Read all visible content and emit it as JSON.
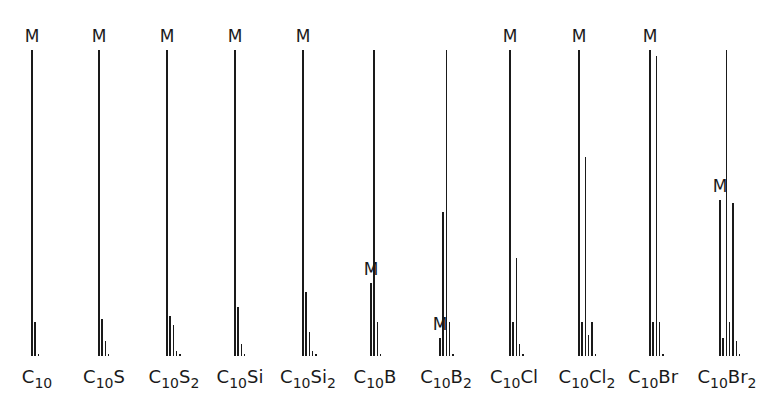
{
  "chart_data": {
    "type": "bar",
    "title": "",
    "xlabel": "",
    "ylabel": "",
    "ylim": [
      0,
      100
    ],
    "grid": false,
    "legend": null,
    "marker_label": "M",
    "groups": [
      {
        "name": "C10",
        "label_parts": [
          [
            "C",
            ""
          ],
          [
            "10",
            "sub"
          ]
        ],
        "m_index": 0,
        "values": [
          100,
          11,
          0.5
        ]
      },
      {
        "name": "C10S",
        "label_parts": [
          [
            "C",
            ""
          ],
          [
            "10",
            "sub"
          ],
          [
            "S",
            ""
          ]
        ],
        "m_index": 0,
        "values": [
          100,
          12,
          5,
          0.5
        ]
      },
      {
        "name": "C10S2",
        "label_parts": [
          [
            "C",
            ""
          ],
          [
            "10",
            "sub"
          ],
          [
            "S",
            ""
          ],
          [
            "2",
            "sub"
          ]
        ],
        "m_index": 0,
        "values": [
          100,
          13,
          10,
          1.5,
          0.5
        ]
      },
      {
        "name": "C10Si",
        "label_parts": [
          [
            "C",
            ""
          ],
          [
            "10",
            "sub"
          ],
          [
            "Si",
            ""
          ]
        ],
        "m_index": 0,
        "values": [
          100,
          16,
          4,
          0.5
        ]
      },
      {
        "name": "C10Si2",
        "label_parts": [
          [
            "C",
            ""
          ],
          [
            "10",
            "sub"
          ],
          [
            "Si",
            ""
          ],
          [
            "2",
            "sub"
          ]
        ],
        "m_index": 0,
        "values": [
          100,
          21,
          8,
          1.5,
          0.5
        ]
      },
      {
        "name": "C10B",
        "label_parts": [
          [
            "C",
            ""
          ],
          [
            "10",
            "sub"
          ],
          [
            "B",
            ""
          ]
        ],
        "m_index": 0,
        "values": [
          24,
          100,
          11,
          0.5
        ]
      },
      {
        "name": "C10B2",
        "label_parts": [
          [
            "C",
            ""
          ],
          [
            "10",
            "sub"
          ],
          [
            "B",
            ""
          ],
          [
            "2",
            "sub"
          ]
        ],
        "m_index": 0,
        "values": [
          6,
          47,
          100,
          11,
          0.5
        ]
      },
      {
        "name": "C10Cl",
        "label_parts": [
          [
            "C",
            ""
          ],
          [
            "10",
            "sub"
          ],
          [
            "Cl",
            ""
          ]
        ],
        "m_index": 0,
        "values": [
          100,
          11,
          32,
          4,
          0.5
        ]
      },
      {
        "name": "C10Cl2",
        "label_parts": [
          [
            "C",
            ""
          ],
          [
            "10",
            "sub"
          ],
          [
            "Cl",
            ""
          ],
          [
            "2",
            "sub"
          ]
        ],
        "m_index": 0,
        "values": [
          100,
          11,
          65,
          7,
          11,
          0.5
        ]
      },
      {
        "name": "C10Br",
        "label_parts": [
          [
            "C",
            ""
          ],
          [
            "10",
            "sub"
          ],
          [
            "Br",
            ""
          ]
        ],
        "m_index": 0,
        "values": [
          100,
          11,
          98,
          11,
          0.5
        ]
      },
      {
        "name": "C10Br2",
        "label_parts": [
          [
            "C",
            ""
          ],
          [
            "10",
            "sub"
          ],
          [
            "Br",
            ""
          ],
          [
            "2",
            "sub"
          ]
        ],
        "m_index": 0,
        "values": [
          51,
          6,
          100,
          11,
          50,
          5,
          0.5
        ]
      }
    ]
  },
  "layout": {
    "baseline_y": 356,
    "full_height_px": 306,
    "bar_spacing_px": 3.3,
    "group_x": [
      31,
      98,
      166,
      234,
      302,
      370,
      439,
      509,
      578,
      649,
      719
    ],
    "label_x": [
      37,
      104,
      174,
      240,
      308,
      375,
      446,
      514,
      587,
      653,
      727
    ],
    "bar_color": "#1a1a1a"
  }
}
